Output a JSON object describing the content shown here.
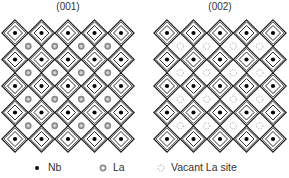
{
  "panels": [
    {
      "title": "(001)",
      "a_site": "La",
      "b_site": "Nb",
      "rows": 5,
      "cols": 5,
      "a_site_grid": "4x4"
    },
    {
      "title": "(002)",
      "a_site": "Vacant La site",
      "b_site": "Nb",
      "rows": 5,
      "cols": 5,
      "a_site_grid": "4x4"
    }
  ],
  "legend": {
    "items": [
      {
        "symbol": "filled-black-dot",
        "label": "Nb"
      },
      {
        "symbol": "gray-ring-dot",
        "label": "La"
      },
      {
        "symbol": "dashed-circle",
        "label": "Vacant La site"
      }
    ]
  },
  "colors": {
    "line": "#1a1a1a",
    "nb": "#000000",
    "la": "#8a8a8a",
    "vacant": "#9a9a9a"
  }
}
